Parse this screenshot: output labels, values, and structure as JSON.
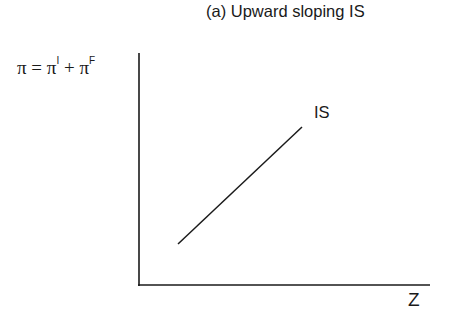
{
  "chart_data": {
    "type": "line",
    "title": "(a) Upward sloping IS",
    "xlabel": "Z",
    "ylabel": {
      "base": "π = π",
      "sup1": "I",
      "mid": " + π",
      "sup2": "F"
    },
    "ylabel_text": "π = π^I + π^F",
    "grid": false,
    "legend": null,
    "series": [
      {
        "name": "IS",
        "label": "IS",
        "slope": "upward",
        "points_px": [
          [
            178,
            244
          ],
          [
            302,
            127
          ]
        ]
      }
    ],
    "axes": {
      "origin_px": [
        139,
        285
      ],
      "x_end_px": 430,
      "y_top_px": 53,
      "ticks": false
    }
  }
}
